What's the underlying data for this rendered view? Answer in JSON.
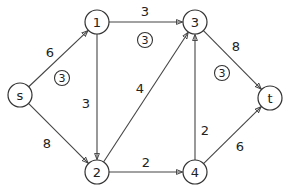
{
  "nodes": [
    {
      "id": "s",
      "label": "s"
    },
    {
      "id": "1",
      "label": "1"
    },
    {
      "id": "3",
      "label": "3"
    },
    {
      "id": "t",
      "label": "t"
    },
    {
      "id": "2",
      "label": "2"
    },
    {
      "id": "4",
      "label": "4"
    }
  ],
  "edges": [
    {
      "from": "s",
      "to": "1",
      "capacity": "6"
    },
    {
      "from": "s",
      "to": "2",
      "capacity": "8"
    },
    {
      "from": "1",
      "to": "3",
      "capacity": "3"
    },
    {
      "from": "1",
      "to": "2",
      "capacity": "3"
    },
    {
      "from": "2",
      "to": "3",
      "capacity": "4"
    },
    {
      "from": "2",
      "to": "4",
      "capacity": "2"
    },
    {
      "from": "4",
      "to": "3",
      "capacity": "2"
    },
    {
      "from": "3",
      "to": "t",
      "capacity": "8"
    },
    {
      "from": "4",
      "to": "t",
      "capacity": "6"
    }
  ],
  "annotations": [
    {
      "label": "3",
      "near_edge": "s-1"
    },
    {
      "label": "3",
      "near_edge": "1-3"
    },
    {
      "label": "3",
      "near_edge": "3-t"
    }
  ]
}
